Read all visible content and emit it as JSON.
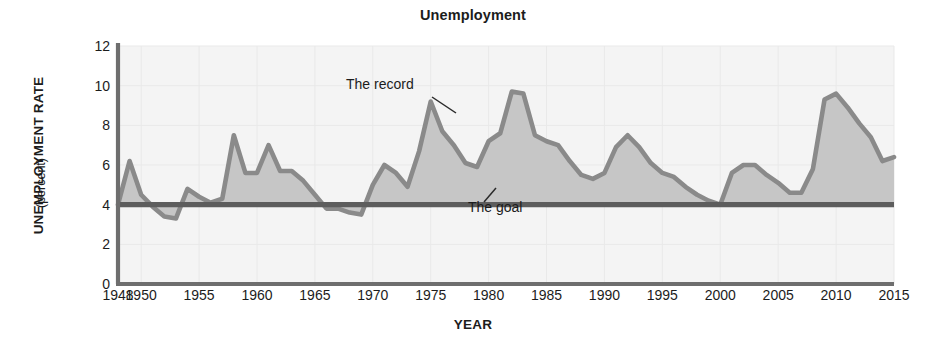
{
  "chart_data": {
    "type": "area",
    "title": "Unemployment",
    "xlabel": "YEAR",
    "ylabel": "UNEMPLOYMENT RATE",
    "ylabel_sub": "(percent)",
    "xlim": [
      1948,
      2015
    ],
    "ylim": [
      0,
      12
    ],
    "yticks": [
      0,
      2,
      4,
      6,
      8,
      10,
      12
    ],
    "xticks": [
      1948,
      1950,
      1955,
      1960,
      1965,
      1970,
      1975,
      1980,
      1985,
      1990,
      1995,
      2000,
      2005,
      2010,
      2015
    ],
    "grid": true,
    "legend": "none",
    "series": [
      {
        "name": "The record",
        "kind": "area",
        "baseline": 4.0,
        "x": [
          1948,
          1949,
          1950,
          1951,
          1952,
          1953,
          1954,
          1955,
          1956,
          1957,
          1958,
          1959,
          1960,
          1961,
          1962,
          1963,
          1964,
          1965,
          1966,
          1967,
          1968,
          1969,
          1970,
          1971,
          1972,
          1973,
          1974,
          1975,
          1976,
          1977,
          1978,
          1979,
          1980,
          1981,
          1982,
          1983,
          1984,
          1985,
          1986,
          1987,
          1988,
          1989,
          1990,
          1991,
          1992,
          1993,
          1994,
          1995,
          1996,
          1997,
          1998,
          1999,
          2000,
          2001,
          2002,
          2003,
          2004,
          2005,
          2006,
          2007,
          2008,
          2009,
          2010,
          2011,
          2012,
          2013,
          2014,
          2015
        ],
        "values": [
          4.0,
          6.2,
          4.5,
          3.9,
          3.4,
          3.3,
          4.8,
          4.4,
          4.1,
          4.3,
          7.5,
          5.6,
          5.6,
          7.0,
          5.7,
          5.7,
          5.2,
          4.5,
          3.8,
          3.8,
          3.6,
          3.5,
          5.0,
          6.0,
          5.6,
          4.9,
          6.7,
          9.2,
          7.7,
          7.0,
          6.1,
          5.9,
          7.2,
          7.6,
          9.7,
          9.6,
          7.5,
          7.2,
          7.0,
          6.2,
          5.5,
          5.3,
          5.6,
          6.9,
          7.5,
          6.9,
          6.1,
          5.6,
          5.4,
          4.9,
          4.5,
          4.2,
          4.0,
          5.6,
          6.0,
          6.0,
          5.5,
          5.1,
          4.6,
          4.6,
          5.8,
          9.3,
          9.6,
          8.9,
          8.1,
          7.4,
          6.2,
          6.4
        ]
      },
      {
        "name": "The goal",
        "kind": "hline",
        "value": 4.0
      }
    ],
    "annotations": [
      {
        "text": "The record",
        "x": 1973,
        "y": 10.4
      },
      {
        "text": "The goal",
        "x": 1979,
        "y": 2.6
      }
    ],
    "colors": {
      "area_fill": "#c6c6c6",
      "record_line": "#8a8a8a",
      "goal_line": "#5d5d5d",
      "axis": "#6e6e6e",
      "grid": "#e9e9e9",
      "plot_bg": "#f4f4f4",
      "text": "#1c1c1c"
    }
  },
  "axes": {
    "y_title": "UNEMPLOYMENT RATE",
    "y_subtitle": "(percent)",
    "x_title": "YEAR",
    "yticks": [
      "12",
      "10",
      "8",
      "6",
      "4",
      "2",
      "0"
    ],
    "xticks": [
      "1948",
      "1950",
      "1955",
      "1960",
      "1965",
      "1970",
      "1975",
      "1980",
      "1985",
      "1990",
      "1995",
      "2000",
      "2005",
      "2010",
      "2015"
    ]
  },
  "title": "Unemployment",
  "annotations": {
    "record": "The record",
    "goal": "The goal"
  }
}
